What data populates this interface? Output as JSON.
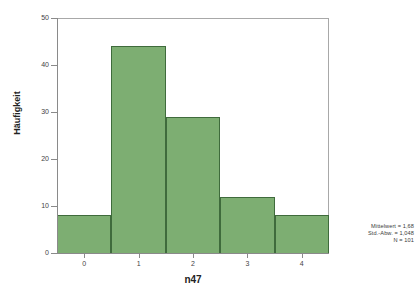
{
  "chart_data": {
    "type": "bar",
    "title": "",
    "subtitle": "",
    "xlabel": "n47",
    "ylabel": "Häufigkeit",
    "categories": [
      "0",
      "1",
      "2",
      "3",
      "4"
    ],
    "values": [
      8,
      44,
      29,
      12,
      8
    ],
    "series": [
      {
        "name": "Häufigkeit",
        "values": [
          8,
          44,
          29,
          12,
          8
        ]
      }
    ],
    "ylim": [
      0,
      50
    ],
    "y_ticks": [
      0,
      10,
      20,
      30,
      40,
      50
    ],
    "y_tick_labels": [
      "0",
      "10",
      "20",
      "30",
      "40",
      "50"
    ],
    "x_ticks": [
      0,
      1,
      2,
      3,
      4
    ],
    "x_tick_labels": [
      "0",
      "1",
      "2",
      "3",
      "4"
    ],
    "grid": false,
    "legend": null,
    "bar_fill_color": "#7dae72",
    "bar_edge_color": "#3f6b3c",
    "plot_frame_color": "#a8a8a8",
    "background_color": "#ffffff",
    "annotations": [
      "Mittelwert = 1,68",
      "Std.-Abw. = 1,048",
      "N = 101"
    ]
  },
  "stats": {
    "mean_label": "Mittelwert = 1,68",
    "sd_label": "Std.-Abw. = 1,048",
    "n_label": "N = 101"
  }
}
